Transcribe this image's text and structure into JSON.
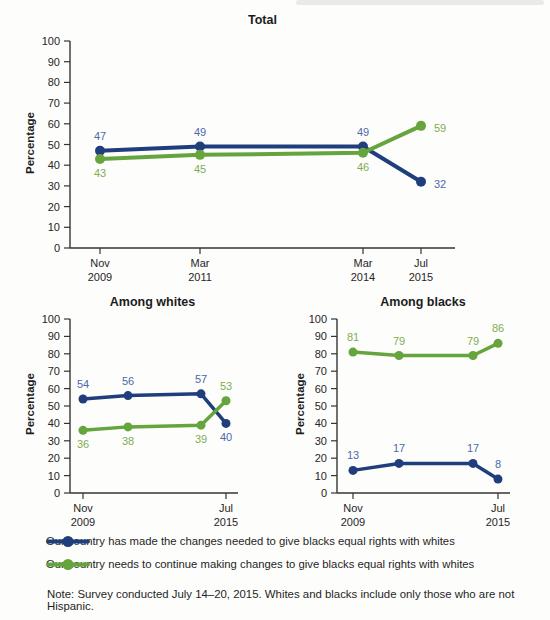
{
  "page": {
    "note": "Note: Survey conducted July 14–20, 2015. Whites and blacks include only those who are not Hispanic."
  },
  "colors": {
    "blue_line": "#203e7c",
    "green_line": "#66a43e",
    "blue_label": "#4e68a8",
    "green_label": "#7dad52",
    "axis": "#343434",
    "text": "#232323"
  },
  "legend": {
    "items": [
      {
        "key": "made_changes",
        "color": "blue",
        "label": "Our country has made the changes needed to give blacks equal rights with whites"
      },
      {
        "key": "continue_changes",
        "color": "green",
        "label": "Our country needs to continue making changes to give blacks equal rights with whites"
      }
    ]
  },
  "chart_data": [
    {
      "id": "total",
      "type": "line",
      "title": "Total",
      "ylabel": "Percentage",
      "ylim": [
        0,
        100
      ],
      "ytick_step": 10,
      "grid": false,
      "categories": [
        "Nov 2009",
        "Mar 2011",
        "Mar 2014",
        "Jul 2015"
      ],
      "xticks": [
        {
          "index": 0,
          "month": "Nov",
          "year": "2009"
        },
        {
          "index": 1,
          "month": "Mar",
          "year": "2011"
        },
        {
          "index": 2,
          "month": "Mar",
          "year": "2014"
        },
        {
          "index": 3,
          "month": "Jul",
          "year": "2015"
        }
      ],
      "series": [
        {
          "name": "made_changes",
          "color": "blue",
          "values": [
            47,
            49,
            49,
            32
          ],
          "label_pos": [
            "above",
            "above",
            "above",
            "right"
          ]
        },
        {
          "name": "continue_changes",
          "color": "green",
          "values": [
            43,
            45,
            46,
            59
          ],
          "label_pos": [
            "below",
            "below",
            "below",
            "right"
          ]
        }
      ]
    },
    {
      "id": "whites",
      "type": "line",
      "title": "Among whites",
      "ylabel": "Percentage",
      "ylim": [
        0,
        100
      ],
      "ytick_step": 10,
      "grid": false,
      "categories": [
        "Nov 2009",
        "Mar 2011",
        "Mar 2014",
        "Jul 2015"
      ],
      "xticks": [
        {
          "index": 0,
          "month": "Nov",
          "year": "2009"
        },
        {
          "index": 3,
          "month": "Jul",
          "year": "2015"
        }
      ],
      "series": [
        {
          "name": "made_changes",
          "color": "blue",
          "values": [
            54,
            56,
            57,
            40
          ],
          "label_pos": [
            "above",
            "above",
            "above",
            "below"
          ]
        },
        {
          "name": "continue_changes",
          "color": "green",
          "values": [
            36,
            38,
            39,
            53
          ],
          "label_pos": [
            "below",
            "below",
            "below",
            "above"
          ]
        }
      ]
    },
    {
      "id": "blacks",
      "type": "line",
      "title": "Among blacks",
      "ylabel": "Percentage",
      "ylim": [
        0,
        100
      ],
      "ytick_step": 10,
      "grid": false,
      "categories": [
        "Nov 2009",
        "Mar 2011",
        "Mar 2014",
        "Jul 2015"
      ],
      "xticks": [
        {
          "index": 0,
          "month": "Nov",
          "year": "2009"
        },
        {
          "index": 3,
          "month": "Jul",
          "year": "2015"
        }
      ],
      "series": [
        {
          "name": "made_changes",
          "color": "blue",
          "values": [
            13,
            17,
            17,
            8
          ],
          "label_pos": [
            "above",
            "above",
            "above",
            "above"
          ]
        },
        {
          "name": "continue_changes",
          "color": "green",
          "values": [
            81,
            79,
            79,
            86
          ],
          "label_pos": [
            "above",
            "above",
            "above",
            "above"
          ]
        }
      ]
    }
  ]
}
